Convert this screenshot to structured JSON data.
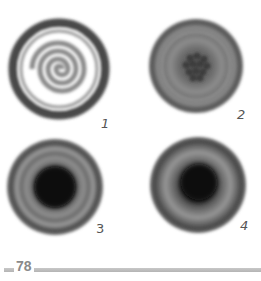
{
  "page": {
    "number": "78"
  },
  "figures": [
    {
      "label": "1",
      "pattern": "spiral",
      "description": "circle with light spiral on white center"
    },
    {
      "label": "2",
      "pattern": "dot-cluster",
      "description": "gray circle with cluster of dark dots at center"
    },
    {
      "label": "3",
      "pattern": "dark-core",
      "description": "gray circle with large dark core"
    },
    {
      "label": "4",
      "pattern": "dark-core",
      "description": "gray circle with dark core, lighter ring"
    }
  ],
  "colors": {
    "ring_dark": "#4a4a4a",
    "ring_mid": "#7a7a7a",
    "ring_light": "#a8a8a8",
    "core_dark": "#111111",
    "rule": "#bdbdbd",
    "page_number": "#8a8a8a"
  }
}
